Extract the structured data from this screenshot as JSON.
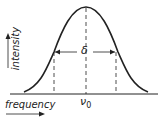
{
  "diagram": {
    "curve": "gaussian",
    "labels": {
      "y_axis": "intensity",
      "x_axis": "frequency",
      "center": "ν",
      "center_sub": "0",
      "width": "δ"
    },
    "colors": {
      "line": "#222222",
      "background": "#ffffff"
    }
  }
}
